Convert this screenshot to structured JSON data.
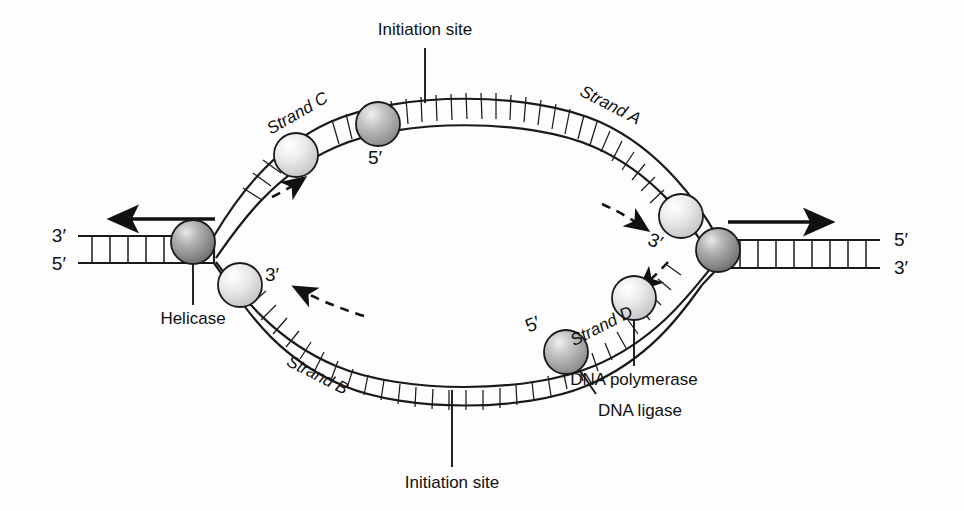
{
  "diagram": {
    "background_color": "#fdfdfd",
    "line_color": "#1a1a1a"
  },
  "labels": {
    "initiation_site_top": "Initiation site",
    "initiation_site_bottom": "Initiation site",
    "strand_a": "Strand A",
    "strand_b": "Strand B",
    "strand_c": "Strand C",
    "strand_d": "Strand D",
    "helicase": "Helicase",
    "dna_polymerase": "DNA polymerase",
    "dna_ligase": "DNA ligase"
  },
  "ends": {
    "left_top": "3′",
    "left_bottom": "5′",
    "right_top": "5′",
    "right_bottom": "3′",
    "strand_c_5prime": "5′",
    "strand_a_3prime": "3′",
    "strand_b_3prime": "3′",
    "strand_d_5prime": "5′"
  },
  "colors": {
    "helicase_sphere": "#8c8c8c",
    "ligase_sphere": "#a8a8a8",
    "polymerase_sphere": "#dcdcdc",
    "stroke": "#1a1a1a"
  },
  "arrows": {
    "left_fork_direction": "leftward",
    "right_fork_direction": "rightward",
    "strand_c_synthesis": "up-right",
    "strand_a_synthesis": "down-right",
    "strand_b_synthesis": "up-left",
    "strand_d_synthesis": "down-left"
  }
}
